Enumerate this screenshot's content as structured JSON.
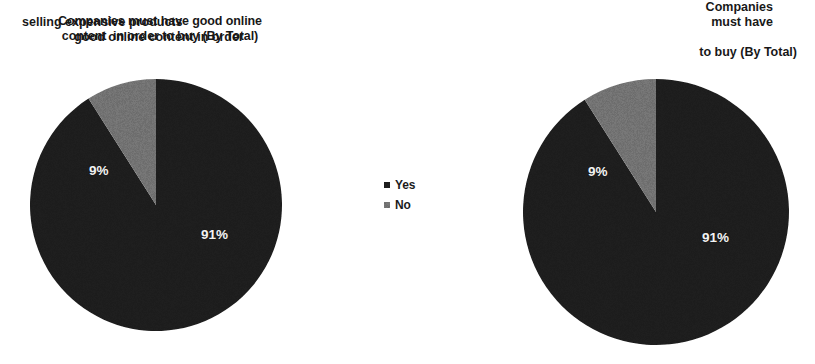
{
  "page": {
    "background": "#ffffff",
    "width": 815,
    "height": 364
  },
  "colors": {
    "yes_slice": "#1c1c1c",
    "no_slice": "#6e6e6e",
    "label_text": "#f2f2f2",
    "title_text": "#161616"
  },
  "charts": {
    "left": {
      "title": "Companies must have good online\ncontent  in order to buy (By Total)",
      "labels": {
        "yes": "91%",
        "no": "9%"
      }
    },
    "right": {
      "title_lines": {
        "l1": "Companies",
        "l2a": "selling expensive products",
        "l2b": "must have",
        "l3": "good online content in order",
        "l4": "to buy (By Total)"
      },
      "labels": {
        "yes": "91%",
        "no": "9%"
      }
    }
  },
  "legend": {
    "items": [
      {
        "label": "Yes",
        "color": "#1c1c1c",
        "marker": "square-marker"
      },
      {
        "label": "No",
        "color": "#6e6e6e",
        "marker": "square-marker"
      }
    ]
  },
  "chart_data": [
    {
      "type": "pie",
      "title": "Companies must have good online content  in order to buy (By Total)",
      "categories": [
        "Yes",
        "No"
      ],
      "values": [
        91,
        9
      ],
      "value_unit": "%",
      "data_labels": [
        "91%",
        "9%"
      ],
      "colors": [
        "#1c1c1c",
        "#6e6e6e"
      ],
      "legend": [
        "Yes",
        "No"
      ],
      "legend_position": "center-right",
      "start_angle_deg": 0,
      "direction": "clockwise",
      "grid": false
    },
    {
      "type": "pie",
      "title": "Companies selling expensive products must have good online content in order to buy (By Total)",
      "categories": [
        "Yes",
        "No"
      ],
      "values": [
        91,
        9
      ],
      "value_unit": "%",
      "data_labels": [
        "91%",
        "9%"
      ],
      "colors": [
        "#1c1c1c",
        "#6e6e6e"
      ],
      "legend": [
        "Yes",
        "No"
      ],
      "legend_position": "center-left-shared",
      "start_angle_deg": 0,
      "direction": "clockwise",
      "grid": false
    }
  ]
}
